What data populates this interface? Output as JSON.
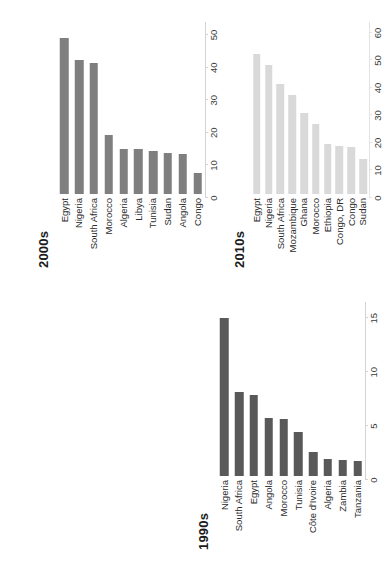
{
  "page": {
    "background_color": "#ffffff",
    "orientation": "rotated-90",
    "figure_kind": "three-panel horizontal bar charts"
  },
  "panels": [
    {
      "id": "panel-1990s",
      "title": "1990s",
      "bar_color": "#595959",
      "axis_color": "#d4d4d4",
      "label_color": "#2b2b2b"
    },
    {
      "id": "panel-2000s",
      "title": "2000s",
      "bar_color": "#7f7f7f",
      "axis_color": "#d4d4d4",
      "label_color": "#2b2b2b"
    },
    {
      "id": "panel-2010s",
      "title": "2010s",
      "bar_color": "#d9d9d9",
      "axis_color": "#e3e3e3",
      "label_color": "#2b2b2b"
    }
  ],
  "chart_data": [
    {
      "type": "bar",
      "orientation": "horizontal",
      "title": "1990s",
      "xlabel": "",
      "ylabel": "",
      "xlim": [
        0,
        16.5
      ],
      "xticks": [
        0,
        5,
        10,
        15
      ],
      "tick_labels": [
        "0",
        "5",
        "10",
        "15"
      ],
      "grid": false,
      "legend": "none",
      "color": "#595959",
      "categories": [
        "Nigeria",
        "South Africa",
        "Egypt",
        "Angola",
        "Morocco",
        "Tunisia",
        "Côte d'Ivoire",
        "Algeria",
        "Zambia",
        "Tanzania"
      ],
      "values": [
        15.0,
        8.0,
        7.7,
        5.5,
        5.4,
        4.2,
        2.3,
        1.6,
        1.5,
        1.4
      ]
    },
    {
      "type": "bar",
      "orientation": "horizontal",
      "title": "2000s",
      "xlabel": "",
      "ylabel": "",
      "xlim": [
        0,
        54
      ],
      "xticks": [
        0,
        10,
        20,
        30,
        40,
        50
      ],
      "tick_labels": [
        "0",
        "10",
        "20",
        "30",
        "40",
        "50"
      ],
      "grid": false,
      "legend": "none",
      "color": "#7f7f7f",
      "categories": [
        "Egypt",
        "Nigeria",
        "South Africa",
        "Morocco",
        "Algeria",
        "Libya",
        "Tunisia",
        "Sudan",
        "Angola",
        "Congo"
      ],
      "values": [
        49.0,
        42.0,
        41.0,
        18.5,
        14.0,
        14.0,
        13.5,
        13.0,
        12.5,
        6.5
      ]
    },
    {
      "type": "bar",
      "orientation": "horizontal",
      "title": "2010s",
      "xlabel": "",
      "ylabel": "",
      "xlim": [
        0,
        64
      ],
      "xticks": [
        0,
        10,
        20,
        30,
        40,
        50,
        60
      ],
      "tick_labels": [
        "0",
        "10",
        "20",
        "30",
        "40",
        "50",
        "60"
      ],
      "grid": false,
      "legend": "none",
      "color": "#d9d9d9",
      "categories": [
        "Egypt",
        "Nigeria",
        "South Africa",
        "Mozambique",
        "Ghana",
        "Morocco",
        "Ethiopia",
        "Congo, DR",
        "Congo",
        "Sudan"
      ],
      "values": [
        52.0,
        48.0,
        41.0,
        37.0,
        30.0,
        26.0,
        18.5,
        18.0,
        17.5,
        13.0
      ]
    }
  ]
}
